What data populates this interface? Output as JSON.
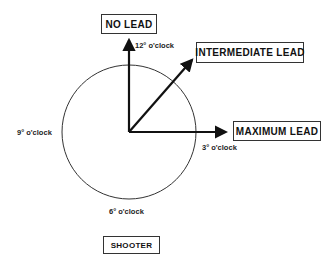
{
  "labels": {
    "no_lead": "NO LEAD",
    "intermediate_lead": "INTERMEDIATE LEAD",
    "maximum_lead": "MAXIMUM LEAD",
    "shooter": "SHOOTER",
    "twelve": "12° o'clock",
    "three": "3° o'clock",
    "six": "6° o'clock",
    "nine": "9° o'clock"
  },
  "geometry": {
    "center": [
      129,
      132
    ],
    "radius": 67
  },
  "colors": {
    "line": "#111111",
    "text": "#111111",
    "background": "#ffffff"
  }
}
